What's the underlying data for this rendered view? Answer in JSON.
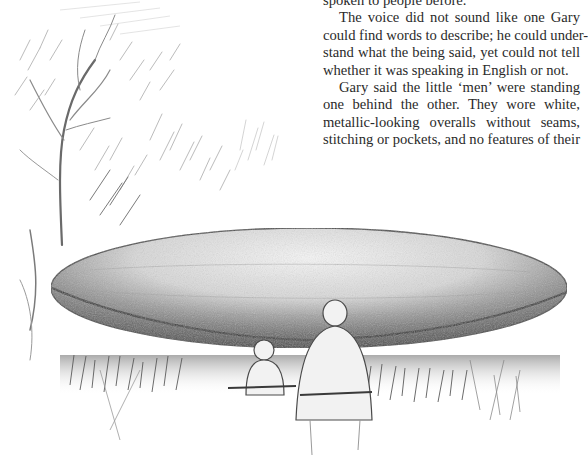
{
  "page": {
    "text": {
      "paragraphs": [
        {
          "indent": false,
          "lines": [
            "spoken to people before."
          ]
        },
        {
          "indent": true,
          "lines": [
            "The voice did not sound like one Gary",
            "could find words to describe; he could under-",
            "stand what the being said, yet could not tell",
            "whether it was speaking in English or not."
          ]
        },
        {
          "indent": true,
          "lines": [
            "Gary said the little ‘men’ were standing",
            "one behind the other. They wore white,",
            "metallic-looking overalls without seams,",
            "stitching or pockets, and no features of their"
          ]
        }
      ]
    },
    "illustration": {
      "subject": "pencil sketch of a large elongated disc-shaped craft hovering low over grass, trees at left, two small figures in the grass below it",
      "colors": {
        "ink": "#3a3a3a",
        "shade": "#6e6e6e",
        "light": "#bdbdbd",
        "paper": "#ffffff"
      }
    }
  }
}
